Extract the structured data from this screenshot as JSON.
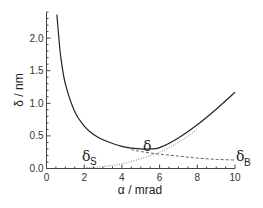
{
  "chart_data": {
    "type": "line",
    "title": "",
    "xlabel": "α / mrad",
    "ylabel": "δ / nm",
    "xlim": [
      0,
      10
    ],
    "ylim": [
      0,
      2.4
    ],
    "grid": false,
    "legend": "none (inline annotations)",
    "x_ticks": [
      "0",
      "2",
      "4",
      "6",
      "8",
      "10"
    ],
    "y_ticks": [
      "0.0",
      "0.5",
      "1.0",
      "1.5",
      "2.0"
    ],
    "series": [
      {
        "name": "δ",
        "style": "solid",
        "x": [
          0.55,
          0.75,
          1.0,
          1.5,
          2.0,
          2.5,
          3.0,
          4.0,
          5.0,
          5.5,
          6.0,
          7.0,
          8.0,
          9.0,
          10.0
        ],
        "values": [
          2.36,
          1.73,
          1.3,
          0.87,
          0.65,
          0.52,
          0.44,
          0.34,
          0.3,
          0.3,
          0.32,
          0.47,
          0.67,
          0.91,
          1.17
        ]
      },
      {
        "name": "δ_B",
        "style": "dashed",
        "x": [
          4.5,
          5.0,
          6.0,
          7.0,
          8.0,
          9.0,
          10.0
        ],
        "values": [
          0.29,
          0.26,
          0.22,
          0.19,
          0.16,
          0.14,
          0.13
        ]
      },
      {
        "name": "δ_S",
        "style": "dotted",
        "x": [
          2.0,
          3.0,
          4.0,
          5.0,
          6.0,
          7.0,
          8.0
        ],
        "values": [
          0.01,
          0.03,
          0.07,
          0.15,
          0.25,
          0.4,
          0.6
        ]
      }
    ],
    "annotations": [
      {
        "text": "δ",
        "x": 5.3,
        "y": 0.33
      },
      {
        "text": "δ_S",
        "x": 2.1,
        "y": 0.12
      },
      {
        "text": "δ_B",
        "x": 10.0,
        "y": 0.1
      }
    ]
  },
  "labels": {
    "xlabel": "α / mrad",
    "ylabel": "δ / nm",
    "annot_delta": "δ",
    "annot_delta_s": "δ",
    "annot_delta_s_sub": "S",
    "annot_delta_b": "δ",
    "annot_delta_b_sub": "B"
  },
  "ticks": {
    "x": [
      "0",
      "2",
      "4",
      "6",
      "8",
      "10"
    ],
    "y": [
      "0.0",
      "0.5",
      "1.0",
      "1.5",
      "2.0"
    ]
  }
}
